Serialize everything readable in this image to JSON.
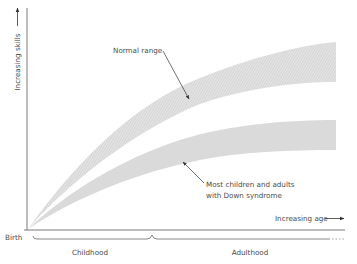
{
  "diagram": {
    "y_axis_label": "Increasing skills",
    "x_axis_label": "Increasing age",
    "origin_label": "Birth",
    "periods": [
      "Childhood",
      "Adulthood"
    ],
    "bands": [
      {
        "name": "normal-range",
        "label": "Normal range"
      },
      {
        "name": "down-syndrome-range",
        "label_lines": [
          "Most children and adults",
          "with Down syndrome"
        ]
      }
    ],
    "colors": {
      "band_fill": "#dcdcdc",
      "hatch": "#c6c6c6",
      "axis": "#7a7a7a",
      "text": "#4a4a4a",
      "arrow": "#333333"
    }
  }
}
